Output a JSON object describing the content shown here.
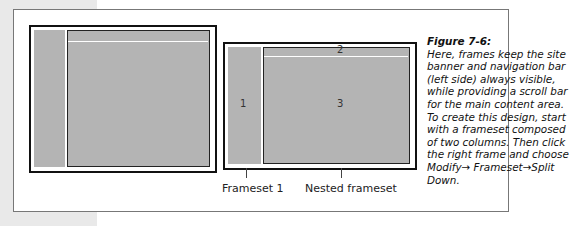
{
  "figure": {
    "number": "Figure 7-6:",
    "caption": "Here, frames keep the site banner and navigation bar (left side) always visible, while providing a scroll bar for the main content area. To create this design, start with a frameset composed of two columns. Then click the right frame and choose Modify→ Frameset→Split Down."
  },
  "diagram": {
    "frames": [
      "1",
      "2",
      "3"
    ],
    "labels": {
      "frameset1": "Frameset 1",
      "nested": "Nested frameset"
    }
  }
}
